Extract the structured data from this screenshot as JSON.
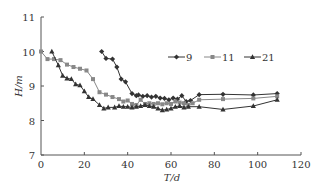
{
  "chart_data": {
    "type": "line",
    "title": "",
    "xlabel": "T/d",
    "ylabel": "H/m",
    "xlim": [
      0,
      120
    ],
    "ylim": [
      7,
      11
    ],
    "xticks": [
      0,
      20,
      40,
      60,
      80,
      100,
      120
    ],
    "yticks": [
      7,
      8,
      9,
      10,
      11
    ],
    "xtick_labels": [
      "0",
      "20",
      "40",
      "60",
      "80",
      "100",
      "120"
    ],
    "ytick_labels": [
      "7",
      "8",
      "9",
      "10",
      "11"
    ],
    "grid": false,
    "legend_position": "right-middle",
    "series": [
      {
        "name": "9",
        "marker": "diamond",
        "color": "#333333",
        "x": [
          28,
          30,
          33,
          35,
          37,
          39,
          42,
          44,
          45,
          47,
          49,
          51,
          53,
          55,
          57,
          59,
          61,
          63,
          65,
          67,
          69,
          73,
          84,
          98,
          109
        ],
        "y": [
          10.0,
          9.8,
          9.78,
          9.55,
          9.2,
          9.12,
          8.78,
          8.72,
          8.74,
          8.7,
          8.72,
          8.68,
          8.7,
          8.65,
          8.64,
          8.6,
          8.65,
          8.62,
          8.72,
          8.55,
          8.58,
          8.75,
          8.76,
          8.74,
          8.78
        ]
      },
      {
        "name": "11",
        "marker": "square",
        "color": "#888888",
        "x": [
          0,
          3,
          6,
          9,
          12,
          15,
          18,
          21,
          24,
          27,
          30,
          33,
          36,
          38,
          40,
          42,
          44,
          46,
          48,
          50,
          52,
          54,
          56,
          58,
          60,
          62,
          64,
          66,
          68,
          70,
          73,
          84,
          98,
          109
        ],
        "y": [
          10.0,
          9.78,
          9.78,
          9.75,
          9.62,
          9.55,
          9.5,
          9.45,
          9.2,
          8.82,
          8.75,
          8.68,
          8.62,
          8.55,
          8.58,
          8.48,
          8.45,
          8.6,
          8.48,
          8.5,
          8.48,
          8.5,
          8.47,
          8.5,
          8.48,
          8.55,
          8.52,
          8.5,
          8.45,
          8.5,
          8.6,
          8.62,
          8.64,
          8.7
        ]
      },
      {
        "name": "21",
        "marker": "triangle",
        "color": "#333333",
        "x": [
          5,
          8,
          10,
          12,
          14,
          16,
          18,
          20,
          22,
          24,
          27,
          29,
          31,
          34,
          36,
          38,
          40,
          42,
          44,
          46,
          48,
          50,
          52,
          54,
          56,
          58,
          60,
          62,
          64,
          66,
          68,
          73,
          84,
          98,
          109
        ],
        "y": [
          10.0,
          9.6,
          9.3,
          9.22,
          9.2,
          9.05,
          9.02,
          8.85,
          8.68,
          8.62,
          8.45,
          8.35,
          8.38,
          8.38,
          8.42,
          8.4,
          8.4,
          8.38,
          8.4,
          8.42,
          8.45,
          8.42,
          8.4,
          8.35,
          8.3,
          8.32,
          8.35,
          8.4,
          8.42,
          8.38,
          8.4,
          8.4,
          8.32,
          8.42,
          8.6
        ]
      }
    ]
  }
}
